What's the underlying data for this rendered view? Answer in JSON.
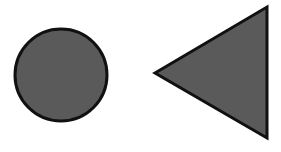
{
  "canvas": {
    "width": 281,
    "height": 152,
    "background": "#ffffff"
  },
  "shapes": [
    {
      "type": "circle",
      "label": "circle",
      "cx": 61,
      "cy": 75,
      "r": 46,
      "fill": "#5a5a5a",
      "stroke": "#111111",
      "stroke_width": 3
    },
    {
      "type": "triangle",
      "label": "triangle-pointing-left",
      "points": "155,73 267,7 267,138",
      "fill": "#5a5a5a",
      "stroke": "#111111",
      "stroke_width": 3
    }
  ]
}
